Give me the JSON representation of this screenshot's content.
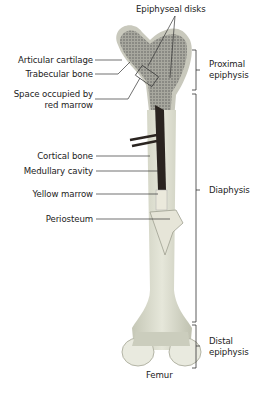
{
  "title": "Femur",
  "left_labels": [
    {
      "id": "articular-cartilage",
      "text": "Articular cartilage"
    },
    {
      "id": "trabecular-bone",
      "text": "Trabecular bone"
    },
    {
      "id": "space-red-marrow",
      "line1": "Space occupied by",
      "line2": "red marrow"
    },
    {
      "id": "cortical-bone",
      "text": "Cortical bone"
    },
    {
      "id": "medullary-cavity",
      "text": "Medullary cavity"
    },
    {
      "id": "yellow-marrow",
      "text": "Yellow marrow"
    },
    {
      "id": "periosteum",
      "text": "Periosteum"
    }
  ],
  "top_label": {
    "text": "Epiphyseal disks"
  },
  "right_labels": [
    {
      "id": "proximal-epiphysis",
      "line1": "Proximal",
      "line2": "epiphysis"
    },
    {
      "id": "diaphysis",
      "text": "Diaphysis"
    },
    {
      "id": "distal-epiphysis",
      "line1": "Distal",
      "line2": "epiphysis"
    }
  ],
  "colors": {
    "bone": "#dfe0d2",
    "bone_shadow": "#b9bbab",
    "spongy": "#9a9a92",
    "marrow_dark": "#2a2420",
    "yellow_marrow": "#e8e6d8",
    "line": "#333333"
  }
}
